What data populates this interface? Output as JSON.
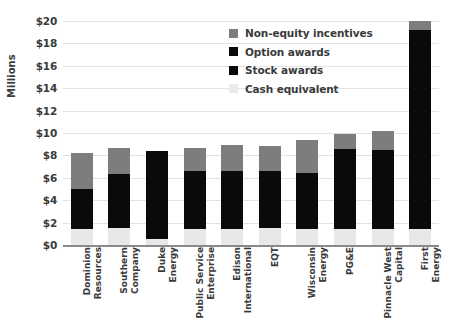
{
  "chart_data": {
    "type": "bar",
    "subtype": "stacked-vertical",
    "title": "",
    "xlabel": "",
    "ylabel": "Millions",
    "ylim": [
      0,
      20
    ],
    "ytick_step": 2,
    "grid": true,
    "legend_position": "top-right",
    "ytick_labels": [
      "$0",
      "$2",
      "$4",
      "$6",
      "$8",
      "$10",
      "$12",
      "$14",
      "$16",
      "$18",
      "$20"
    ],
    "categories": [
      "Dominion Resources",
      "Southern Company",
      "Duke Energy",
      "Public Service Enterprise",
      "Edison International",
      "EQT",
      "Wisconsin Energy",
      "PG&E",
      "Pinnacle West Capital",
      "First Energy"
    ],
    "category_lines": [
      [
        "Dominion",
        "Resources"
      ],
      [
        "Southern",
        "Company"
      ],
      [
        "Duke",
        "Energy"
      ],
      [
        "Public Service",
        "Enterprise"
      ],
      [
        "Edison",
        "International"
      ],
      [
        "EQT"
      ],
      [
        "Wisconsin",
        "Energy"
      ],
      [
        "PG&E"
      ],
      [
        "Pinnacle West",
        "Capital"
      ],
      [
        "First",
        "Energy"
      ]
    ],
    "series": [
      {
        "name": "Cash equivalent",
        "color": "#e8e8e8",
        "values": [
          1.4,
          1.5,
          0.5,
          1.4,
          1.4,
          1.5,
          1.4,
          1.4,
          1.4,
          1.4
        ]
      },
      {
        "name": "Stock awards",
        "color": "#0a0a0a",
        "values": [
          3.6,
          4.8,
          7.9,
          5.2,
          5.2,
          5.1,
          5.0,
          7.2,
          7.1,
          17.8
        ]
      },
      {
        "name": "Option awards",
        "color": "#0a0a0a",
        "values": [
          0,
          0,
          0,
          0,
          0,
          0,
          0,
          0,
          0,
          0
        ]
      },
      {
        "name": "Non-equity incentives",
        "color": "#7d7d7d",
        "values": [
          3.2,
          2.4,
          0.0,
          2.1,
          2.3,
          2.2,
          3.0,
          1.3,
          1.7,
          0.8
        ]
      }
    ],
    "totals": [
      8.2,
      8.7,
      8.4,
      8.7,
      8.9,
      8.8,
      9.4,
      9.9,
      10.2,
      20.0
    ]
  },
  "legend": {
    "items": [
      {
        "label": "Non-equity incentives",
        "color": "#7d7d7d"
      },
      {
        "label": "Option awards",
        "color": "#0a0a0a"
      },
      {
        "label": "Stock awards",
        "color": "#0a0a0a"
      },
      {
        "label": "Cash equivalent",
        "color": "#ebebeb"
      }
    ]
  },
  "axis": {
    "y_title": "Millions"
  },
  "colors": {
    "grid": "#e2e2e2",
    "baseline": "#8a8a8a",
    "text": "#3a3a3a",
    "background": "#ffffff"
  }
}
